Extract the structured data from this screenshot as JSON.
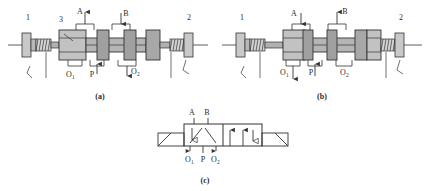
{
  "figure": {
    "background_color": "#ffffff",
    "line_color": "#333333",
    "body_fill": "#b8b8b8",
    "light_fill": "#d4d4d4",
    "land_fill": "#9a9a9a",
    "text_color": "#2b2b2b"
  },
  "panels": [
    {
      "id": "a",
      "caption": "(a)",
      "description": "Spool shifted left: port P connects to A, port B connects to O2",
      "callouts": [
        {
          "name": "item-1",
          "text": "1"
        },
        {
          "name": "item-3",
          "text": "3"
        },
        {
          "name": "item-2",
          "text": "2"
        }
      ],
      "ports": [
        {
          "name": "port-A",
          "base": "A",
          "sub": "",
          "flow": "up"
        },
        {
          "name": "port-B",
          "base": "B",
          "sub": "",
          "flow": "down"
        },
        {
          "name": "port-O1",
          "base": "O",
          "sub": "1",
          "flow": "down"
        },
        {
          "name": "port-P",
          "base": "P",
          "sub": "",
          "flow": "up"
        },
        {
          "name": "port-O2",
          "base": "O",
          "sub": "2",
          "flow": "down"
        }
      ]
    },
    {
      "id": "b",
      "caption": "(b)",
      "description": "Spool shifted right: port P connects to B, port A connects to O1",
      "callouts": [
        {
          "name": "item-1",
          "text": "1"
        },
        {
          "name": "item-2",
          "text": "2"
        }
      ],
      "ports": [
        {
          "name": "port-A",
          "base": "A",
          "sub": "",
          "flow": "down"
        },
        {
          "name": "port-B",
          "base": "B",
          "sub": "",
          "flow": "up"
        },
        {
          "name": "port-O1",
          "base": "O",
          "sub": "1",
          "flow": "down"
        },
        {
          "name": "port-P",
          "base": "P",
          "sub": "",
          "flow": "up"
        },
        {
          "name": "port-O2",
          "base": "O",
          "sub": "2",
          "flow": ""
        }
      ]
    },
    {
      "id": "c",
      "caption": "(c)",
      "description": "Two-position four-way directional control valve ISO symbol",
      "callouts": [],
      "ports": [
        {
          "name": "port-A",
          "base": "A",
          "sub": "",
          "flow": ""
        },
        {
          "name": "port-B",
          "base": "B",
          "sub": "",
          "flow": ""
        },
        {
          "name": "port-O1",
          "base": "O",
          "sub": "1",
          "flow": "down"
        },
        {
          "name": "port-P",
          "base": "P",
          "sub": "",
          "flow": ""
        },
        {
          "name": "port-O2",
          "base": "O",
          "sub": "2",
          "flow": "down"
        }
      ]
    }
  ]
}
